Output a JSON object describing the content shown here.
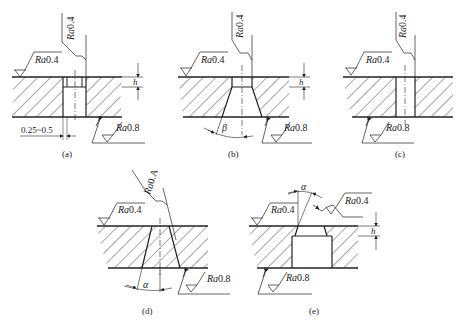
{
  "figure": {
    "panels": [
      {
        "id": "a",
        "caption": "(a)",
        "roughness_top_surface": "Ra0.4",
        "roughness_hole_wall": "Ra0.4",
        "roughness_bottom": "Ra0.8",
        "dimension_h": "h",
        "dimension_width": "0.25~0.5"
      },
      {
        "id": "b",
        "caption": "(b)",
        "roughness_top_surface": "Ra0.4",
        "roughness_hole_wall": "Ra0.4",
        "roughness_bottom": "Ra0.8",
        "dimension_h": "h",
        "angle": "β"
      },
      {
        "id": "c",
        "caption": "(c)",
        "roughness_top_surface": "Ra0.4",
        "roughness_hole_wall": "Ra0.4",
        "roughness_bottom": "Ra0.8"
      },
      {
        "id": "d",
        "caption": "(d)",
        "roughness_top_surface": "Ra0.4",
        "roughness_hole_wall": "Ra0.4",
        "roughness_bottom": "Ra0.8",
        "angle": "α"
      },
      {
        "id": "e",
        "caption": "(e)",
        "roughness_top_surface": "Ra0.4",
        "roughness_hole_wall": "Ra0.4",
        "roughness_bottom": "Ra0.8",
        "dimension_h": "h",
        "angle": "α"
      }
    ]
  }
}
